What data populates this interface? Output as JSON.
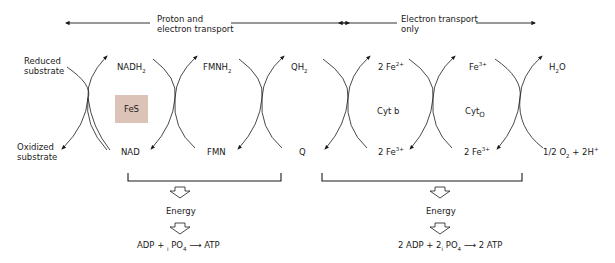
{
  "header": {
    "left_span_label_line1": "Proton and",
    "left_span_label_line2": "electron transport",
    "right_span_label_line1": "Electron transport",
    "right_span_label_line2": "only"
  },
  "nodes": {
    "top": [
      {
        "id": "reduced-substrate",
        "line1": "Reduced",
        "line2": "substrate"
      },
      {
        "id": "nadh2",
        "base": "NADH",
        "sub": "2"
      },
      {
        "id": "fmnh2",
        "base": "FMNH",
        "sub": "2"
      },
      {
        "id": "qh2",
        "base": "QH",
        "sub": "2"
      },
      {
        "id": "2fe2-top",
        "base": "2 Fe",
        "sup": "2+"
      },
      {
        "id": "fe3-top",
        "base": "Fe",
        "sup": "3+"
      },
      {
        "id": "h2o",
        "base": "H",
        "sub": "2",
        "tail": "O"
      }
    ],
    "bottom": [
      {
        "id": "oxidized-substrate",
        "line1": "Oxidized",
        "line2": "substrate"
      },
      {
        "id": "nad",
        "base": "NAD"
      },
      {
        "id": "fmn",
        "base": "FMN"
      },
      {
        "id": "q",
        "base": "Q"
      },
      {
        "id": "2fe3-bottom-1",
        "base": "2 Fe",
        "sup": "3+"
      },
      {
        "id": "2fe3-bottom-2",
        "base": "2 Fe",
        "sup": "3+"
      },
      {
        "id": "half-o2",
        "base": "1/2 O",
        "sub": "2",
        "tail": " + 2H",
        "sup": "+"
      }
    ]
  },
  "carriers": {
    "fes": "FeS",
    "cyt_b": "Cyt b",
    "cyt_o_base": "Cyt",
    "cyt_o_sub": "O"
  },
  "energy": {
    "left": {
      "label": "Energy",
      "eq_a": "ADP + ",
      "eq_i": "i",
      "eq_b": " PO",
      "eq_sub": "4",
      "eq_arrow": "⟶",
      "eq_c": " ATP"
    },
    "right": {
      "label": "Energy",
      "eq_a": "2 ADP + 2",
      "eq_i": "i",
      "eq_b": " PO",
      "eq_sub": "4",
      "eq_arrow": "⟶",
      "eq_c": " 2 ATP"
    }
  },
  "colors": {
    "line": "#1a1a1a",
    "fes_box": "#dcc3b8",
    "background": "#ffffff"
  }
}
